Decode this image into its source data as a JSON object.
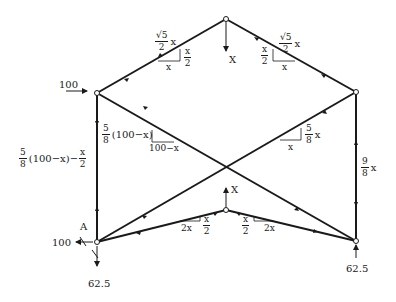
{
  "diagram": {
    "type": "truss-force-diagram",
    "nodes": {
      "top": {
        "x": 226,
        "y": 19
      },
      "left": {
        "x": 97,
        "y": 93
      },
      "right": {
        "x": 356,
        "y": 92
      },
      "bottom_left": {
        "x": 97,
        "y": 242,
        "label": "A"
      },
      "bottom_right": {
        "x": 356,
        "y": 241
      },
      "bottom_center": {
        "x": 226,
        "y": 210
      }
    },
    "loads": {
      "left_horizontal": "100",
      "top_vertical": "X",
      "center_vertical": "X",
      "reaction_A_horizontal": "100",
      "reaction_A_vertical": "62.5",
      "reaction_right_vertical": "62.5"
    },
    "member_labels": {
      "top_left_force": {
        "num": "√5",
        "den": "2",
        "suffix": "x"
      },
      "top_left_slope_rise": {
        "num": "x",
        "den": "2"
      },
      "top_left_slope_run": "x",
      "top_right_force": {
        "num": "√5",
        "den": "2",
        "suffix": "x"
      },
      "top_right_slope_rise": {
        "num": "x",
        "den": "2"
      },
      "top_right_slope_run": "x",
      "diag_left_force": {
        "num": "5",
        "den": "8",
        "suffix": "(100−x)"
      },
      "diag_left_slope_run": "100−x",
      "diag_right_force": {
        "num": "5",
        "den": "8",
        "suffix": "x"
      },
      "diag_right_slope_run": "x",
      "left_vertical_force": {
        "num": "5",
        "den": "8",
        "suffix": "(100−x)−",
        "num2": "x",
        "den2": "2"
      },
      "right_vertical_force": {
        "num": "9",
        "den": "8",
        "suffix": "x"
      },
      "bottom_left_slope_run": "2x",
      "bottom_left_slope_rise": {
        "num": "x",
        "den": "2"
      },
      "bottom_right_slope_run": "2x",
      "bottom_right_slope_rise": {
        "num": "x",
        "den": "2"
      }
    },
    "colors": {
      "line": "#1a1a1a",
      "background": "#ffffff"
    }
  }
}
